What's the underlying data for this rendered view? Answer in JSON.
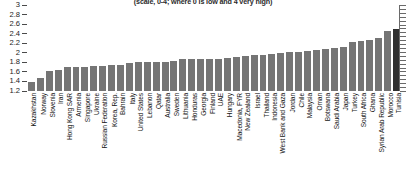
{
  "chart_data": {
    "type": "bar",
    "title": "(scale, 0-4; where 0 is low and 4 very high)",
    "xlabel": "",
    "ylabel": "",
    "ylim": [
      1.2,
      3
    ],
    "yticks": [
      "3",
      "2.8",
      "2.6",
      "2.4",
      "2.2",
      "2",
      "1.8",
      "1.6",
      "1.4",
      "1.2"
    ],
    "grid": false,
    "legend": "none",
    "highlight_color": "#2f2f2f",
    "bar_color": "#757575",
    "highlighted_category": "Tunisia",
    "categories": [
      "Kazakhstan",
      "Norway",
      "Slovenia",
      "Iran",
      "Hong Kong SAR",
      "Armenia",
      "Singapore",
      "Ukraine",
      "Russian Federation",
      "Korea, Rep.",
      "Bahrain",
      "Italy",
      "United States",
      "Lebanon",
      "Qatar",
      "Australia",
      "Sweden",
      "Lithuania",
      "Honduras",
      "Georgia",
      "Finland",
      "UAE",
      "Hungary",
      "Macedonia, FYR",
      "New Zealand",
      "Israel",
      "Thailand",
      "Indonesia",
      "West Bank and Gaza",
      "Jordan",
      "Chile",
      "Malaysia",
      "Oman",
      "Botswana",
      "Saudi Arabia",
      "Japan",
      "Turkey",
      "South Africa",
      "Ghana",
      "Syrian Arab Republic",
      "Morocco",
      "Tunisia"
    ],
    "values": [
      1.38,
      1.47,
      1.62,
      1.63,
      1.7,
      1.7,
      1.71,
      1.72,
      1.73,
      1.74,
      1.75,
      1.79,
      1.8,
      1.8,
      1.81,
      1.81,
      1.83,
      1.86,
      1.86,
      1.87,
      1.87,
      1.88,
      1.9,
      1.92,
      1.93,
      1.95,
      1.96,
      1.98,
      2.0,
      2.01,
      2.02,
      2.04,
      2.05,
      2.07,
      2.1,
      2.13,
      2.22,
      2.25,
      2.26,
      2.32,
      2.45,
      2.5
    ]
  }
}
